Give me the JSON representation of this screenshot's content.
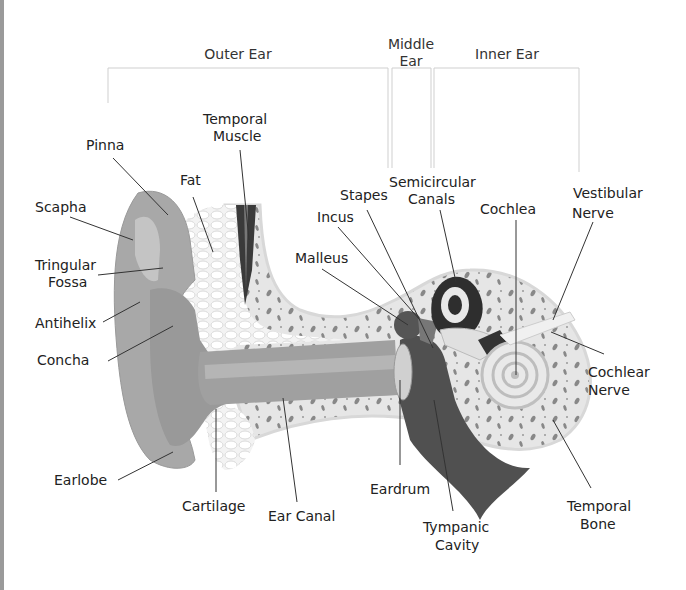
{
  "diagram": {
    "sections": {
      "outer_ear": "Outer Ear",
      "middle_ear_1": "Middle",
      "middle_ear_2": "Ear",
      "inner_ear": "Inner Ear"
    },
    "labels": {
      "pinna": "Pinna",
      "scapha": "Scapha",
      "tringular_fossa_1": "Tringular",
      "tringular_fossa_2": "Fossa",
      "antihelix": "Antihelix",
      "concha": "Concha",
      "earlobe": "Earlobe",
      "fat": "Fat",
      "temporal_muscle_1": "Temporal",
      "temporal_muscle_2": "Muscle",
      "cartilage": "Cartilage",
      "ear_canal": "Ear Canal",
      "malleus": "Malleus",
      "incus": "Incus",
      "stapes": "Stapes",
      "semicircular_canals_1": "Semicircular",
      "semicircular_canals_2": "Canals",
      "cochlea": "Cochlea",
      "vestibular_nerve_1": "Vestibular",
      "vestibular_nerve_2": "Nerve",
      "cochlear_nerve_1": "Cochlear",
      "cochlear_nerve_2": "Nerve",
      "eardrum": "Eardrum",
      "tympanic_cavity_1": "Tympanic",
      "tympanic_cavity_2": "Cavity",
      "temporal_bone_1": "Temporal",
      "temporal_bone_2": "Bone"
    },
    "colors": {
      "skin": "#a8a8a8",
      "fat": "#eeeeee",
      "bone": "#e2e2e2",
      "dark": "#3a3a3a",
      "bracket": "#cfcfcf"
    }
  }
}
